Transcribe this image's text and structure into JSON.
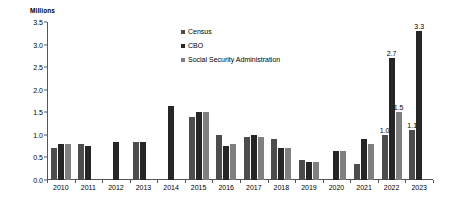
{
  "chart_data": {
    "type": "bar",
    "title": "",
    "subtitle": "",
    "ylabel": "Millions",
    "xlabel": "",
    "ylim": [
      0,
      3.5
    ],
    "ytick_labels": [
      "0.0",
      "0.5",
      "1.0",
      "1.5",
      "2.0",
      "2.5",
      "3.0",
      "3.5"
    ],
    "ytick_values": [
      0.0,
      0.5,
      1.0,
      1.5,
      2.0,
      2.5,
      3.0,
      3.5
    ],
    "grid": false,
    "legend_position": "top-center",
    "categories": [
      "2010",
      "2011",
      "2012",
      "2013",
      "2014",
      "2015",
      "2016",
      "2017",
      "2018",
      "2019",
      "2020",
      "2021",
      "2022",
      "2023"
    ],
    "series": [
      {
        "name": "Census",
        "color": "#4d4d4d",
        "values": [
          0.7,
          0.8,
          0.0,
          0.85,
          0.0,
          1.4,
          1.0,
          0.95,
          0.9,
          0.45,
          0.0,
          0.35,
          1.0,
          1.1
        ]
      },
      {
        "name": "CBO",
        "color": "#262626",
        "values": [
          0.8,
          0.75,
          0.85,
          0.85,
          1.65,
          1.5,
          0.75,
          1.0,
          0.7,
          0.4,
          0.65,
          0.9,
          2.7,
          3.3
        ]
      },
      {
        "name": "Social Security Administration",
        "color": "#808080",
        "values": [
          0.8,
          0.0,
          0.0,
          0.0,
          0.0,
          1.5,
          0.8,
          0.95,
          0.7,
          0.4,
          0.65,
          0.8,
          1.5,
          0.0
        ]
      }
    ],
    "data_labels": {
      "2022": {
        "Census": "1.0",
        "CBO": "2.7",
        "Social Security Administration": "1.5"
      },
      "2023": {
        "Census": "1.1",
        "CBO": "3.3"
      }
    }
  }
}
